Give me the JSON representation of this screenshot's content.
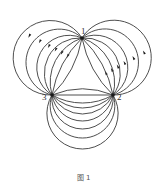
{
  "figure": {
    "caption": "图 1",
    "nodes": [
      {
        "id": "1",
        "label": "1",
        "x": 82,
        "y": 38,
        "label_dx": -1,
        "label_dy": -4
      },
      {
        "id": "2",
        "label": "2",
        "x": 113,
        "y": 95,
        "label_dx": 4,
        "label_dy": 5
      },
      {
        "id": "3",
        "label": "3",
        "x": 52,
        "y": 95,
        "label_dx": -10,
        "label_dy": 5
      }
    ],
    "edges": [
      {
        "from": "3",
        "to": "2",
        "sagittas": [
          0,
          -6,
          8,
          13,
          19,
          26,
          34,
          43,
          54
        ],
        "arrows": false
      },
      {
        "from": "1",
        "to": "3",
        "sagittas": [
          -5,
          5,
          13,
          21,
          30,
          42,
          56
        ],
        "arrows": true
      },
      {
        "from": "2",
        "to": "1",
        "sagittas": [
          -5,
          5,
          13,
          21,
          30,
          42,
          56
        ],
        "arrows": true
      }
    ],
    "colors": {
      "stroke": "#3a3a3a",
      "node": "#1a1a1a",
      "background": "#ffffff"
    }
  }
}
